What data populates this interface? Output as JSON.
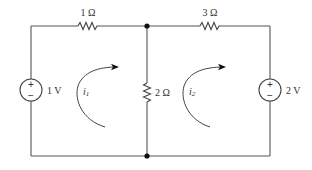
{
  "diagram": {
    "type": "circuit",
    "resistors": [
      {
        "id": "r1",
        "label": "1 Ω",
        "value_ohm": 1,
        "position": "top-left branch"
      },
      {
        "id": "r3",
        "label": "3 Ω",
        "value_ohm": 3,
        "position": "top-right branch"
      },
      {
        "id": "r2",
        "label": "2 Ω",
        "value_ohm": 2,
        "position": "middle vertical branch"
      }
    ],
    "sources": [
      {
        "id": "v1",
        "label": "1 V",
        "value_v": 1,
        "position": "left branch",
        "plus": "+",
        "minus": "−"
      },
      {
        "id": "v2",
        "label": "2 V",
        "value_v": 2,
        "position": "right branch",
        "plus": "+",
        "minus": "−"
      }
    ],
    "loops": [
      {
        "id": "i1",
        "label_main": "i",
        "label_sub": "1",
        "direction": "clockwise"
      },
      {
        "id": "i2",
        "label_main": "i",
        "label_sub": "2",
        "direction": "clockwise"
      }
    ],
    "colors": {
      "wire": "#555555",
      "text": "#333333",
      "background": "#ffffff"
    }
  }
}
